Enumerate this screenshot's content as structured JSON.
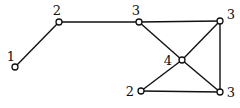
{
  "graph": {
    "nodes": [
      {
        "id": "a",
        "degree_label": "1"
      },
      {
        "id": "b",
        "degree_label": "2"
      },
      {
        "id": "c",
        "degree_label": "3"
      },
      {
        "id": "d",
        "degree_label": "3"
      },
      {
        "id": "e",
        "degree_label": "4"
      },
      {
        "id": "f",
        "degree_label": "2"
      },
      {
        "id": "g",
        "degree_label": "3"
      }
    ],
    "edges": [
      [
        "a",
        "b"
      ],
      [
        "b",
        "c"
      ],
      [
        "c",
        "d"
      ],
      [
        "c",
        "e"
      ],
      [
        "d",
        "e"
      ],
      [
        "d",
        "g"
      ],
      [
        "e",
        "f"
      ],
      [
        "e",
        "g"
      ],
      [
        "f",
        "g"
      ]
    ]
  },
  "caption": "The degree sequence..."
}
